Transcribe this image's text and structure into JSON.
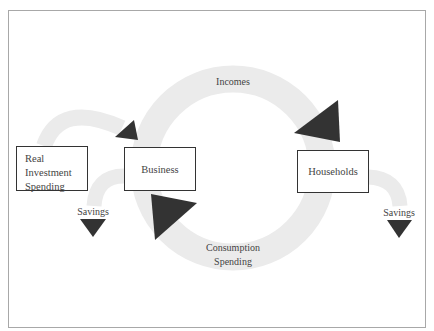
{
  "diagram": {
    "colors": {
      "flow_band": "#ebebeb",
      "arrow_head": "#333333",
      "box_border": "#333333",
      "frame_border": "#a8a8a8",
      "text": "#444444"
    },
    "nodes": {
      "real_investment": {
        "lines": [
          "Real",
          "Investment",
          "Spending"
        ]
      },
      "business": {
        "label": "Business"
      },
      "households": {
        "label": "Households"
      }
    },
    "flows": {
      "incomes": {
        "label": "Incomes",
        "from": "Business",
        "to": "Households"
      },
      "consumption": {
        "line1": "Consumption",
        "line2": "Spending",
        "from": "Households",
        "to": "Business"
      },
      "investment": {
        "from": "Real Investment Spending",
        "to": "Business"
      },
      "savings_left": {
        "label": "Savings",
        "from": "Business"
      },
      "savings_right": {
        "label": "Savings",
        "from": "Households"
      }
    }
  }
}
